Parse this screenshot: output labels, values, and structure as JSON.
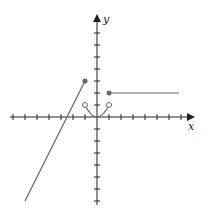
{
  "figure": {
    "type": "piecewise-function-graph",
    "axes": {
      "x_label": "x",
      "y_label": "y",
      "x_range": [
        -7,
        8
      ],
      "y_range": [
        -7,
        8
      ],
      "tick_spacing": 1,
      "tick_labels_shown": false
    },
    "pieces": [
      {
        "kind": "line",
        "equation": "y = 2x + 5",
        "from": [
          -6,
          -7
        ],
        "to": [
          -1,
          3
        ],
        "left_end": "none",
        "right_end": "closed"
      },
      {
        "kind": "parabola",
        "equation": "y = x^2",
        "from": [
          -1,
          1
        ],
        "to": [
          1,
          1
        ],
        "left_end": "open",
        "right_end": "open"
      },
      {
        "kind": "horizontal-line",
        "equation": "y = 2",
        "from": [
          1,
          2
        ],
        "to": [
          7,
          2
        ],
        "left_end": "closed",
        "right_end": "none"
      }
    ],
    "colors": {
      "axis": "#222222",
      "curve": "#666666",
      "dot": "#666666"
    }
  }
}
